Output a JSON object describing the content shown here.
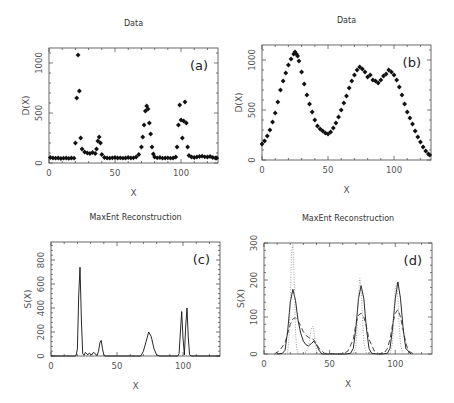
{
  "chart_data": [
    {
      "id": "a",
      "type": "scatter",
      "title": "Data",
      "panel_label": "(a)",
      "xlabel": "X",
      "ylabel": "D(X)",
      "xlim": [
        0,
        128
      ],
      "ylim": [
        0,
        1150
      ],
      "xticks": [
        0,
        50,
        100
      ],
      "yticks": [
        0,
        500,
        1000
      ],
      "frame": {
        "left": 49,
        "top": 48,
        "right": 218,
        "bottom": 163
      },
      "x": [
        1,
        3,
        5,
        7,
        9,
        11,
        13,
        15,
        17,
        19,
        20,
        21,
        22,
        23,
        24,
        25,
        27,
        29,
        31,
        33,
        35,
        36,
        37,
        38,
        39,
        40,
        42,
        44,
        46,
        48,
        50,
        52,
        54,
        56,
        58,
        60,
        62,
        64,
        66,
        68,
        70,
        71,
        72,
        73,
        74,
        75,
        76,
        77,
        78,
        79,
        80,
        82,
        84,
        86,
        88,
        90,
        92,
        94,
        96,
        97,
        98,
        99,
        100,
        101,
        102,
        103,
        104,
        105,
        106,
        108,
        110,
        112,
        114,
        116,
        118,
        120,
        122,
        124,
        126,
        127
      ],
      "y": [
        55,
        50,
        48,
        50,
        45,
        48,
        50,
        46,
        50,
        48,
        200,
        650,
        1080,
        720,
        250,
        140,
        110,
        100,
        95,
        105,
        95,
        140,
        220,
        260,
        200,
        85,
        55,
        50,
        48,
        52,
        55,
        50,
        52,
        48,
        50,
        55,
        50,
        52,
        60,
        85,
        160,
        260,
        380,
        520,
        570,
        540,
        400,
        290,
        160,
        90,
        60,
        52,
        55,
        48,
        50,
        52,
        48,
        50,
        60,
        160,
        380,
        580,
        430,
        250,
        420,
        610,
        400,
        160,
        75,
        60,
        55,
        60,
        65,
        68,
        62,
        60,
        65,
        55,
        50,
        50
      ]
    },
    {
      "id": "b",
      "type": "scatter",
      "title": "Data",
      "panel_label": "(b)",
      "xlabel": "X",
      "ylabel": "D(X)",
      "xlim": [
        0,
        128
      ],
      "ylim": [
        0,
        1150
      ],
      "xticks": [
        0,
        50,
        100
      ],
      "yticks": [
        0,
        500,
        1000
      ],
      "frame": {
        "left": 262,
        "top": 45,
        "right": 431,
        "bottom": 160
      },
      "x": [
        0,
        2,
        4,
        6,
        8,
        10,
        12,
        14,
        16,
        18,
        20,
        22,
        24,
        25,
        26,
        27,
        28,
        30,
        32,
        34,
        36,
        38,
        40,
        42,
        44,
        46,
        48,
        50,
        52,
        54,
        56,
        58,
        60,
        62,
        64,
        66,
        68,
        70,
        72,
        74,
        76,
        78,
        80,
        82,
        84,
        86,
        88,
        90,
        92,
        94,
        96,
        98,
        100,
        102,
        104,
        106,
        108,
        110,
        112,
        114,
        116,
        118,
        120,
        122,
        124,
        126,
        127
      ],
      "y": [
        160,
        190,
        240,
        300,
        380,
        470,
        580,
        700,
        790,
        870,
        950,
        1010,
        1060,
        1080,
        1060,
        1040,
        990,
        880,
        760,
        650,
        560,
        480,
        400,
        340,
        310,
        290,
        270,
        260,
        280,
        320,
        370,
        430,
        500,
        570,
        640,
        720,
        790,
        850,
        900,
        930,
        910,
        880,
        830,
        850,
        800,
        790,
        770,
        800,
        840,
        860,
        900,
        880,
        850,
        800,
        730,
        650,
        560,
        480,
        420,
        360,
        290,
        230,
        180,
        130,
        90,
        60,
        50
      ]
    },
    {
      "id": "c",
      "type": "line",
      "title": "MaxEnt Reconstruction",
      "panel_label": "(c)",
      "xlabel": "X",
      "ylabel": "S(X)",
      "xlim": [
        0,
        128
      ],
      "ylim": [
        0,
        950
      ],
      "xticks": [
        0,
        50,
        100
      ],
      "yticks": [
        0,
        200,
        400,
        600,
        800
      ],
      "frame": {
        "left": 51,
        "top": 242,
        "right": 220,
        "bottom": 356
      },
      "series": [
        {
          "name": "reconstruction",
          "style": "solid",
          "x": [
            0,
            18,
            19,
            20,
            21,
            22,
            23,
            24,
            25,
            26,
            27,
            28,
            29,
            30,
            31,
            32,
            33,
            34,
            35,
            36,
            37,
            38,
            39,
            40,
            41,
            60,
            68,
            70,
            72,
            74,
            76,
            78,
            80,
            82,
            96,
            97,
            98,
            99,
            100,
            101,
            102,
            103,
            104,
            105,
            106,
            128
          ],
          "y": [
            0,
            0,
            5,
            60,
            500,
            740,
            300,
            20,
            5,
            30,
            20,
            10,
            25,
            15,
            10,
            30,
            25,
            10,
            5,
            40,
            110,
            130,
            60,
            10,
            0,
            0,
            0,
            40,
            120,
            200,
            160,
            60,
            10,
            0,
            0,
            20,
            200,
            370,
            150,
            10,
            250,
            400,
            150,
            10,
            0,
            0
          ]
        }
      ]
    },
    {
      "id": "d",
      "type": "line",
      "title": "MaxEnt Reconstruction",
      "panel_label": "(d)",
      "xlabel": "X",
      "ylabel": "S(X)",
      "xlim": [
        0,
        128
      ],
      "ylim": [
        0,
        300
      ],
      "xticks": [
        0,
        50,
        100
      ],
      "yticks": [
        0,
        100,
        200,
        300
      ],
      "frame": {
        "left": 264,
        "top": 243,
        "right": 432,
        "bottom": 354
      },
      "series": [
        {
          "name": "solid",
          "style": "solid",
          "x": [
            10,
            14,
            16,
            18,
            20,
            22,
            24,
            26,
            28,
            30,
            32,
            34,
            36,
            38,
            40,
            42,
            44,
            62,
            66,
            68,
            70,
            72,
            74,
            76,
            78,
            80,
            82,
            86,
            90,
            94,
            96,
            98,
            100,
            102,
            104,
            106,
            108,
            112
          ],
          "y": [
            0,
            2,
            10,
            60,
            140,
            175,
            145,
            90,
            55,
            35,
            25,
            22,
            28,
            35,
            25,
            10,
            0,
            0,
            2,
            15,
            70,
            150,
            185,
            150,
            70,
            15,
            2,
            0,
            0,
            2,
            15,
            70,
            150,
            195,
            150,
            70,
            15,
            0
          ]
        },
        {
          "name": "dashed",
          "style": "dashed",
          "x": [
            8,
            12,
            16,
            18,
            20,
            22,
            24,
            26,
            28,
            30,
            32,
            34,
            36,
            38,
            40,
            42,
            46,
            60,
            64,
            68,
            70,
            72,
            74,
            76,
            78,
            80,
            84,
            88,
            92,
            94,
            96,
            98,
            100,
            102,
            104,
            106,
            108,
            110,
            114
          ],
          "y": [
            0,
            10,
            30,
            55,
            80,
            95,
            98,
            90,
            75,
            60,
            50,
            45,
            42,
            38,
            28,
            15,
            2,
            0,
            8,
            40,
            80,
            105,
            110,
            100,
            75,
            40,
            8,
            0,
            5,
            15,
            40,
            80,
            110,
            120,
            100,
            65,
            30,
            8,
            0
          ]
        },
        {
          "name": "dotted",
          "style": "dotted",
          "x": [
            16,
            18,
            19,
            20,
            21,
            22,
            23,
            24,
            25,
            26,
            28,
            30,
            32,
            34,
            35,
            36,
            37,
            38,
            39,
            40,
            41,
            42,
            68,
            70,
            71,
            72,
            73,
            74,
            75,
            76,
            78,
            80,
            96,
            98,
            99,
            100,
            101,
            102,
            103,
            104,
            106
          ],
          "y": [
            0,
            5,
            40,
            150,
            280,
            295,
            200,
            60,
            10,
            0,
            0,
            0,
            5,
            20,
            45,
            70,
            75,
            60,
            30,
            8,
            2,
            0,
            0,
            20,
            80,
            160,
            205,
            180,
            100,
            30,
            3,
            0,
            0,
            30,
            110,
            180,
            190,
            150,
            80,
            25,
            0
          ]
        }
      ]
    }
  ]
}
